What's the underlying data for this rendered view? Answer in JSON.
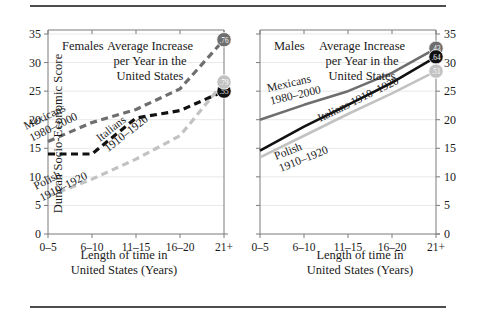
{
  "figure": {
    "y_axis_title": "Duncan Socio-Economic Score",
    "x_axis_title_line1": "Length of time in",
    "x_axis_title_line2": "United States (Years)",
    "annotation_line1": "Average Increase",
    "annotation_line2": "per Year in the",
    "annotation_line3": "United States"
  },
  "colors": {
    "mexicans": "#6e6e6e",
    "italians": "#111111",
    "polish": "#c2c2c2",
    "axis": "#7a7a7a",
    "grid": "#e8e8e8",
    "rule": "#4d4d4d",
    "text": "#1a1a1a"
  },
  "chart_data": [
    {
      "type": "line",
      "id": "females",
      "title": "Females",
      "panel_label": "Females",
      "xlabel": "Length of time in United States (Years)",
      "ylabel": "Duncan Socio-Economic Score",
      "categories": [
        "0–5",
        "6–10",
        "11–15",
        "16–20",
        "21+"
      ],
      "yticks": [
        0,
        5,
        10,
        15,
        20,
        25,
        30,
        35
      ],
      "ylim": [
        0,
        35
      ],
      "grid": true,
      "legend": "inline-labels",
      "series": [
        {
          "name": "Mexicans 1980–2000",
          "label_line1": "Mexicans",
          "label_line2": "1980–2000",
          "style": "dashed",
          "color": "#6e6e6e",
          "values": [
            16.2,
            19.5,
            21.8,
            25.4,
            34.0
          ],
          "endpoint_badge": ".76"
        },
        {
          "name": "Italians 1910–1920",
          "label_line1": "Italians",
          "label_line2": "1910–1920",
          "style": "dashed",
          "color": "#111111",
          "values": [
            14.0,
            14.0,
            20.3,
            21.6,
            25.0
          ],
          "endpoint_badge": ".55"
        },
        {
          "name": "Polish 1910–1920",
          "label_line1": "Polish",
          "label_line2": "1910–1920",
          "style": "dashed",
          "color": "#c2c2c2",
          "values": [
            6.6,
            9.6,
            13.1,
            17.2,
            26.6
          ],
          "endpoint_badge": ".79"
        }
      ]
    },
    {
      "type": "line",
      "id": "males",
      "title": "Males",
      "panel_label": "Males",
      "xlabel": "Length of time in United States (Years)",
      "ylabel": "Duncan Socio-Economic Score",
      "categories": [
        "0–5",
        "6–10",
        "11–15",
        "16–20",
        "21+"
      ],
      "yticks": [
        0,
        5,
        10,
        15,
        20,
        25,
        30,
        35
      ],
      "ylim": [
        0,
        35
      ],
      "grid": true,
      "legend": "inline-labels",
      "series": [
        {
          "name": "Mexicans 1980–2000",
          "label_line1": "Mexicans",
          "label_line2": "1980–2000",
          "style": "solid",
          "color": "#6e6e6e",
          "values": [
            20.0,
            22.6,
            25.0,
            28.2,
            32.5
          ],
          "endpoint_badge": ".43"
        },
        {
          "name": "Italians 1910–1920",
          "label_line1": "Italians 1910–1920",
          "label_line2": "",
          "style": "solid",
          "color": "#111111",
          "values": [
            14.6,
            18.8,
            22.6,
            26.5,
            31.0
          ],
          "endpoint_badge": ".64"
        },
        {
          "name": "Polish 1910–1920",
          "label_line1": "Polish",
          "label_line2": "1910–1920",
          "style": "solid",
          "color": "#c2c2c2",
          "values": [
            13.4,
            17.2,
            21.0,
            24.6,
            28.5
          ],
          "endpoint_badge": ".51"
        }
      ]
    }
  ]
}
